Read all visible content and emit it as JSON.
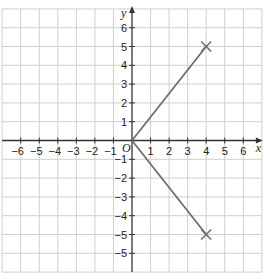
{
  "chart_data": {
    "type": "line",
    "title": "",
    "xlabel": "x",
    "ylabel": "y",
    "origin_label": "O",
    "xlim": [
      -7,
      7
    ],
    "ylim": [
      -7,
      7
    ],
    "grid": true,
    "x_ticks": [
      -6,
      -5,
      -4,
      -3,
      -2,
      -1,
      1,
      2,
      3,
      4,
      5,
      6
    ],
    "x_tick_labels": [
      "−6",
      "−5",
      "−4",
      "−3",
      "−2",
      "−1",
      "1",
      "2",
      "3",
      "4",
      "5",
      "6"
    ],
    "y_ticks": [
      6,
      5,
      4,
      3,
      2,
      1,
      -1,
      -2,
      -3,
      -4,
      -5,
      -6
    ],
    "y_tick_labels": [
      "6",
      "5",
      "4",
      "3",
      "2",
      "1",
      "−1",
      "−2",
      "−3",
      "−4",
      "−5",
      "−5"
    ],
    "series": [
      {
        "name": "segment-upper",
        "points": [
          [
            0,
            0
          ],
          [
            4,
            5
          ]
        ],
        "end_marker": "x"
      },
      {
        "name": "segment-lower",
        "points": [
          [
            0,
            0
          ],
          [
            4,
            -5
          ]
        ],
        "end_marker": "x"
      }
    ],
    "colors": {
      "grid": "#cfcfcf",
      "axis": "#333333",
      "line": "#6e6e6e",
      "text": "#222222"
    }
  }
}
